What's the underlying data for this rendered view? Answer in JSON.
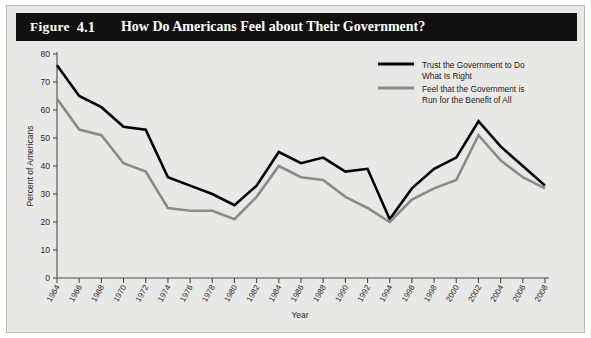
{
  "figure": {
    "label": "Figure",
    "number": "4.1",
    "title": "How Do Americans Feel about Their Government?"
  },
  "colors": {
    "trust_line": "#000000",
    "benefit_line": "#8a8a8a",
    "panel_background": "#e8e8e6",
    "title_bar": "#111111",
    "axis": "#4a4a4a"
  },
  "chart_data": {
    "type": "line",
    "title": "How Do Americans Feel about Their Government?",
    "xlabel": "Year",
    "ylabel": "Percent of Americans",
    "xlim": [
      1964,
      2008
    ],
    "ylim": [
      0,
      80
    ],
    "ytick_interval": 10,
    "grid": false,
    "legend_position": "top-right",
    "categories": [
      "1964",
      "1966",
      "1968",
      "1970",
      "1972",
      "1974",
      "1976",
      "1978",
      "1980",
      "1982",
      "1984",
      "1986",
      "1988",
      "1990",
      "1992",
      "1994",
      "1996",
      "1998",
      "2000",
      "2002",
      "2004",
      "2006",
      "2008"
    ],
    "yticks": [
      "0",
      "10",
      "20",
      "30",
      "40",
      "50",
      "60",
      "70",
      "80"
    ],
    "series": [
      {
        "name": "Trust the Government to Do What Is Right",
        "color": "#000000",
        "values": [
          76,
          65,
          61,
          54,
          53,
          36,
          33,
          30,
          26,
          33,
          45,
          41,
          43,
          38,
          39,
          21,
          32,
          39,
          43,
          56,
          47,
          40,
          33
        ]
      },
      {
        "name": "Feel that the Government is Run for the Benefit of All",
        "color": "#8a8a8a",
        "values": [
          64,
          53,
          51,
          41,
          38,
          25,
          24,
          24,
          21,
          29,
          40,
          36,
          35,
          29,
          25,
          20,
          28,
          32,
          35,
          51,
          42,
          36,
          32
        ]
      }
    ]
  },
  "legend": {
    "items": [
      {
        "line1": "Trust the Government to Do",
        "line2": "What Is Right",
        "color": "#000000"
      },
      {
        "line1": "Feel that the Government is",
        "line2": "Run for the Benefit of All",
        "color": "#8a8a8a"
      }
    ]
  }
}
